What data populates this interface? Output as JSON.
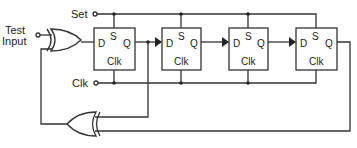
{
  "diagram": {
    "inputs": {
      "test_input": [
        "Test",
        "Input"
      ],
      "set": "Set",
      "clk": "Clk"
    },
    "flipflops": [
      {
        "d": "D",
        "s": "S",
        "q": "Q",
        "clk": "Clk"
      },
      {
        "d": "D",
        "s": "S",
        "q": "Q",
        "clk": "Clk"
      },
      {
        "d": "D",
        "s": "S",
        "q": "Q",
        "clk": "Clk"
      },
      {
        "d": "D",
        "s": "S",
        "q": "Q",
        "clk": "Clk"
      }
    ],
    "gates": [
      {
        "type": "XOR",
        "role": "input-mix"
      },
      {
        "type": "XOR",
        "role": "feedback"
      }
    ],
    "colors": {
      "line": "#333333",
      "background": "#ffffff"
    }
  }
}
